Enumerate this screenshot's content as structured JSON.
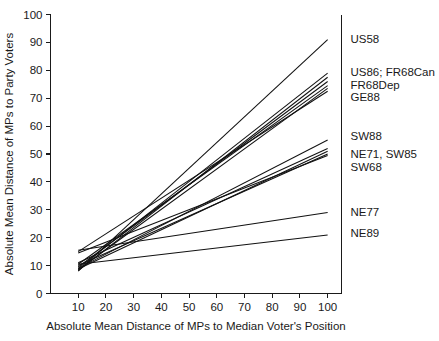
{
  "chart_data": {
    "type": "line",
    "title": "",
    "xlabel": "Absolute Mean Distance of MPs to Median Voter's Position",
    "ylabel": "Absolute Mean Distance of MPs to Party Voters",
    "xlim": [
      0,
      105
    ],
    "ylim": [
      0,
      100
    ],
    "xticks": [
      10,
      20,
      30,
      40,
      50,
      60,
      70,
      80,
      90,
      100
    ],
    "yticks": [
      0,
      10,
      20,
      30,
      40,
      50,
      60,
      70,
      80,
      90,
      100
    ],
    "xtick_labels": [
      "10",
      "20",
      "30",
      "40",
      "50",
      "60",
      "70",
      "80",
      "90",
      "100"
    ],
    "ytick_labels": [
      "0",
      "10",
      "20",
      "30",
      "40",
      "50",
      "60",
      "70",
      "80",
      "90",
      "100"
    ],
    "grid": false,
    "legend_position": "right-outside",
    "line_color": "#111111",
    "series": [
      {
        "name": "US58",
        "label": "US58",
        "x": [
          10,
          100
        ],
        "values": [
          8.0,
          91.0
        ],
        "label_y": 91.0
      },
      {
        "name": "US86; FR68Can",
        "label": "US86; FR68Can",
        "x": [
          10,
          100
        ],
        "values": [
          9.0,
          79.0
        ],
        "label_y": 79.0
      },
      {
        "name": "FR68Dep",
        "label": "FR68Dep",
        "x": [
          10,
          100
        ],
        "values": [
          9.5,
          76.0
        ],
        "label_y": 74.5
      },
      {
        "name": "GE88",
        "label": "GE88",
        "x": [
          10,
          100
        ],
        "values": [
          8.5,
          73.5
        ],
        "label_y": 70.0
      },
      {
        "name": "SW88",
        "label": "SW88",
        "x": [
          10,
          100
        ],
        "values": [
          9.0,
          55.0
        ],
        "label_y": 56.0
      },
      {
        "name": "NE71, SW85",
        "label": "NE71, SW85",
        "x": [
          10,
          100
        ],
        "values": [
          11.0,
          52.0
        ],
        "label_y": 49.5
      },
      {
        "name": "SW68",
        "label": "SW68",
        "x": [
          10,
          100
        ],
        "values": [
          10.0,
          50.0
        ],
        "label_y": 45.0
      },
      {
        "name": "NE77",
        "label": "NE77",
        "x": [
          10,
          100
        ],
        "values": [
          15.5,
          29.0
        ],
        "label_y": 29.0
      },
      {
        "name": "NE89",
        "label": "NE89",
        "x": [
          10,
          100
        ],
        "values": [
          10.5,
          21.0
        ],
        "label_y": 21.5
      }
    ],
    "extra_lines": [
      {
        "name": "unlabeled-1",
        "x": [
          10,
          100
        ],
        "values": [
          8.2,
          77.5
        ]
      },
      {
        "name": "unlabeled-2",
        "x": [
          10,
          100
        ],
        "values": [
          10.5,
          74.5
        ]
      },
      {
        "name": "unlabeled-3",
        "x": [
          10,
          100
        ],
        "values": [
          15.0,
          72.5
        ]
      },
      {
        "name": "unlabeled-4",
        "x": [
          10,
          100
        ],
        "values": [
          8.8,
          51.0
        ]
      },
      {
        "name": "unlabeled-5",
        "x": [
          10,
          100
        ],
        "values": [
          14.5,
          49.5
        ]
      }
    ]
  }
}
